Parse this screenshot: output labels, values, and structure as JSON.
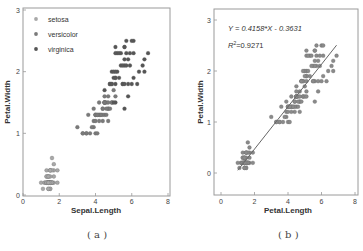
{
  "chart_data": [
    {
      "type": "scatter",
      "panel": "a",
      "caption": "( a )",
      "title": "",
      "xlabel": "Sepal.Length",
      "ylabel": "Petal.Width",
      "xlim": [
        0,
        8
      ],
      "ylim": [
        0,
        3
      ],
      "xticks": [
        0,
        2,
        4,
        6,
        8
      ],
      "yticks": [
        0,
        1,
        2,
        3
      ],
      "grid": false,
      "legend_position": "upper-left",
      "series": [
        {
          "name": "setosa",
          "color": "#a8a8a8",
          "x": [
            1.4,
            1.4,
            1.3,
            1.5,
            1.4,
            1.7,
            1.4,
            1.5,
            1.4,
            1.5,
            1.5,
            1.6,
            1.4,
            1.1,
            1.2,
            1.5,
            1.3,
            1.4,
            1.7,
            1.5,
            1.7,
            1.5,
            1.0,
            1.7,
            1.9,
            1.6,
            1.6,
            1.5,
            1.4,
            1.6,
            1.6,
            1.5,
            1.5,
            1.4,
            1.5,
            1.2,
            1.3,
            1.4,
            1.3,
            1.5,
            1.3,
            1.3,
            1.3,
            1.6,
            1.9,
            1.4,
            1.6,
            1.4,
            1.5,
            1.4
          ],
          "y": [
            0.2,
            0.2,
            0.2,
            0.2,
            0.2,
            0.4,
            0.3,
            0.2,
            0.2,
            0.1,
            0.2,
            0.2,
            0.1,
            0.1,
            0.2,
            0.4,
            0.4,
            0.3,
            0.3,
            0.3,
            0.2,
            0.4,
            0.2,
            0.5,
            0.2,
            0.2,
            0.4,
            0.2,
            0.2,
            0.2,
            0.2,
            0.4,
            0.1,
            0.2,
            0.2,
            0.2,
            0.2,
            0.1,
            0.2,
            0.2,
            0.3,
            0.3,
            0.2,
            0.6,
            0.4,
            0.3,
            0.2,
            0.2,
            0.2,
            0.2
          ]
        },
        {
          "name": "versicolor",
          "color": "#7a7a7a",
          "x": [
            4.7,
            4.5,
            4.9,
            4.0,
            4.6,
            4.5,
            4.7,
            3.3,
            4.6,
            3.9,
            3.5,
            4.2,
            4.0,
            4.7,
            3.6,
            4.4,
            4.5,
            4.1,
            4.5,
            3.9,
            4.8,
            4.0,
            4.9,
            4.7,
            4.3,
            4.4,
            4.8,
            5.0,
            4.5,
            3.5,
            3.8,
            3.7,
            3.9,
            5.1,
            4.5,
            4.5,
            4.7,
            4.4,
            4.1,
            4.0,
            4.4,
            4.6,
            4.0,
            3.3,
            4.2,
            4.2,
            4.2,
            4.3,
            3.0,
            4.1
          ],
          "y": [
            1.4,
            1.5,
            1.5,
            1.3,
            1.5,
            1.3,
            1.6,
            1.0,
            1.3,
            1.4,
            1.0,
            1.5,
            1.0,
            1.4,
            1.3,
            1.4,
            1.5,
            1.0,
            1.5,
            1.1,
            1.8,
            1.3,
            1.5,
            1.2,
            1.3,
            1.4,
            1.4,
            1.7,
            1.5,
            1.0,
            1.1,
            1.0,
            1.2,
            1.6,
            1.5,
            1.6,
            1.5,
            1.3,
            1.3,
            1.3,
            1.2,
            1.4,
            1.2,
            1.0,
            1.3,
            1.2,
            1.3,
            1.3,
            1.1,
            1.3
          ]
        },
        {
          "name": "virginica",
          "color": "#555555",
          "x": [
            6.0,
            5.1,
            5.9,
            5.6,
            5.8,
            6.6,
            4.5,
            6.3,
            5.8,
            6.1,
            5.1,
            5.3,
            5.5,
            5.0,
            5.1,
            5.3,
            5.5,
            6.7,
            6.9,
            5.0,
            5.7,
            4.9,
            6.7,
            4.9,
            5.7,
            6.0,
            4.8,
            4.9,
            5.6,
            5.8,
            6.1,
            6.4,
            5.6,
            5.1,
            5.6,
            6.1,
            5.6,
            5.5,
            4.8,
            5.4,
            5.6,
            5.1,
            5.1,
            5.9,
            5.7,
            5.2,
            5.0,
            5.2,
            5.4,
            5.1
          ],
          "y": [
            2.5,
            1.9,
            2.1,
            1.8,
            2.2,
            2.1,
            1.7,
            1.8,
            1.8,
            2.5,
            2.0,
            1.9,
            2.1,
            2.0,
            2.4,
            2.3,
            1.8,
            2.2,
            2.3,
            1.5,
            2.3,
            2.0,
            2.0,
            1.8,
            2.1,
            1.8,
            1.8,
            1.8,
            2.1,
            1.6,
            1.9,
            2.0,
            2.2,
            1.5,
            1.4,
            2.3,
            2.4,
            1.8,
            1.8,
            2.1,
            2.4,
            2.3,
            1.9,
            2.3,
            2.5,
            2.3,
            1.9,
            2.0,
            2.3,
            1.8
          ]
        }
      ]
    },
    {
      "type": "scatter",
      "panel": "b",
      "caption": "( b )",
      "title": "",
      "xlabel": "Petal.Length",
      "ylabel": "Petal.Width",
      "xlim": [
        -0.4,
        8.2
      ],
      "ylim": [
        -0.4,
        3.2
      ],
      "xticks": [
        0,
        2,
        4,
        6,
        8
      ],
      "yticks": [
        0,
        1,
        2,
        3
      ],
      "grid": false,
      "annotations": {
        "equation": "Y = 0.4158*X - 0.3631",
        "r2_prefix": "R",
        "r2_sup": "2",
        "r2_value": "=0.9271"
      },
      "regression": {
        "slope": 0.4158,
        "intercept": -0.3631,
        "x_range": [
          1.0,
          6.9
        ]
      },
      "series": [
        {
          "name": "all",
          "color": "#8a8a8a",
          "x": [
            1.4,
            1.4,
            1.3,
            1.5,
            1.4,
            1.7,
            1.4,
            1.5,
            1.4,
            1.5,
            1.5,
            1.6,
            1.4,
            1.1,
            1.2,
            1.5,
            1.3,
            1.4,
            1.7,
            1.5,
            1.7,
            1.5,
            1.0,
            1.7,
            1.9,
            1.6,
            1.6,
            1.5,
            1.4,
            1.6,
            1.6,
            1.5,
            1.5,
            1.4,
            1.5,
            1.2,
            1.3,
            1.4,
            1.3,
            1.5,
            1.3,
            1.3,
            1.3,
            1.6,
            1.9,
            1.4,
            1.6,
            1.4,
            1.5,
            1.4,
            4.7,
            4.5,
            4.9,
            4.0,
            4.6,
            4.5,
            4.7,
            3.3,
            4.6,
            3.9,
            3.5,
            4.2,
            4.0,
            4.7,
            3.6,
            4.4,
            4.5,
            4.1,
            4.5,
            3.9,
            4.8,
            4.0,
            4.9,
            4.7,
            4.3,
            4.4,
            4.8,
            5.0,
            4.5,
            3.5,
            3.8,
            3.7,
            3.9,
            5.1,
            4.5,
            4.5,
            4.7,
            4.4,
            4.1,
            4.0,
            4.4,
            4.6,
            4.0,
            3.3,
            4.2,
            4.2,
            4.2,
            4.3,
            3.0,
            4.1,
            6.0,
            5.1,
            5.9,
            5.6,
            5.8,
            6.6,
            4.5,
            6.3,
            5.8,
            6.1,
            5.1,
            5.3,
            5.5,
            5.0,
            5.1,
            5.3,
            5.5,
            6.7,
            6.9,
            5.0,
            5.7,
            4.9,
            6.7,
            4.9,
            5.7,
            6.0,
            4.8,
            4.9,
            5.6,
            5.8,
            6.1,
            6.4,
            5.6,
            5.1,
            5.6,
            6.1,
            5.6,
            5.5,
            4.8,
            5.4,
            5.6,
            5.1,
            5.1,
            5.9,
            5.7,
            5.2,
            5.0,
            5.2,
            5.4,
            5.1
          ],
          "y": [
            0.2,
            0.2,
            0.2,
            0.2,
            0.2,
            0.4,
            0.3,
            0.2,
            0.2,
            0.1,
            0.2,
            0.2,
            0.1,
            0.1,
            0.2,
            0.4,
            0.4,
            0.3,
            0.3,
            0.3,
            0.2,
            0.4,
            0.2,
            0.5,
            0.2,
            0.2,
            0.4,
            0.2,
            0.2,
            0.2,
            0.2,
            0.4,
            0.1,
            0.2,
            0.2,
            0.2,
            0.2,
            0.1,
            0.2,
            0.2,
            0.3,
            0.3,
            0.2,
            0.6,
            0.4,
            0.3,
            0.2,
            0.2,
            0.2,
            0.2,
            1.4,
            1.5,
            1.5,
            1.3,
            1.5,
            1.3,
            1.6,
            1.0,
            1.3,
            1.4,
            1.0,
            1.5,
            1.0,
            1.4,
            1.3,
            1.4,
            1.5,
            1.0,
            1.5,
            1.1,
            1.8,
            1.3,
            1.5,
            1.2,
            1.3,
            1.4,
            1.4,
            1.7,
            1.5,
            1.0,
            1.1,
            1.0,
            1.2,
            1.6,
            1.5,
            1.6,
            1.5,
            1.3,
            1.3,
            1.3,
            1.2,
            1.4,
            1.2,
            1.0,
            1.3,
            1.2,
            1.3,
            1.3,
            1.1,
            1.3,
            2.5,
            1.9,
            2.1,
            1.8,
            2.2,
            2.1,
            1.7,
            1.8,
            1.8,
            2.5,
            2.0,
            1.9,
            2.1,
            2.0,
            2.4,
            2.3,
            1.8,
            2.2,
            2.3,
            1.5,
            2.3,
            2.0,
            2.0,
            1.8,
            2.1,
            1.8,
            1.8,
            1.8,
            2.1,
            1.6,
            1.9,
            2.0,
            2.2,
            1.5,
            1.4,
            2.3,
            2.4,
            1.8,
            1.8,
            2.1,
            2.4,
            2.3,
            1.9,
            2.3,
            2.5,
            2.3,
            1.9,
            2.0,
            2.3,
            1.8
          ]
        }
      ]
    }
  ],
  "colors": {
    "axis": "#999999",
    "text": "#333333",
    "line": "#666666"
  }
}
